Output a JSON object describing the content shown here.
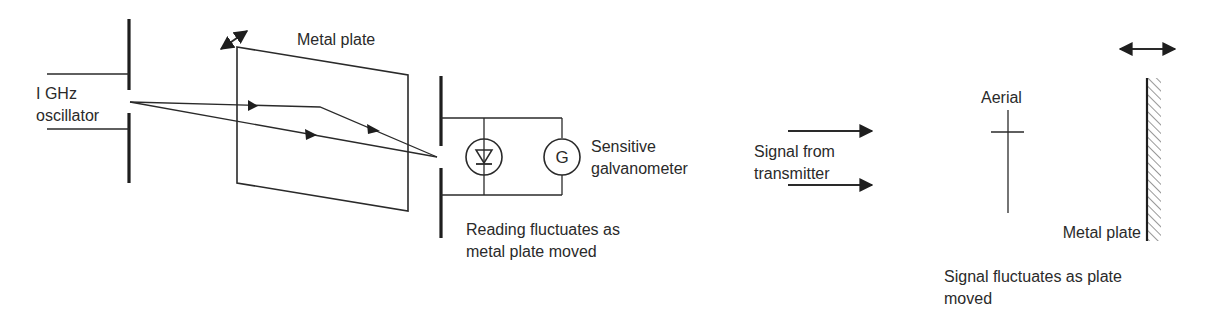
{
  "left_diagram": {
    "oscillator_label_line1": "I GHz",
    "oscillator_label_line2": "oscillator",
    "plate_label": "Metal plate",
    "galvanometer_symbol": "G",
    "galvanometer_label_line1": "Sensitive",
    "galvanometer_label_line2": "galvanometer",
    "caption_line1": "Reading fluctuates as",
    "caption_line2": "metal plate moved",
    "icons": [
      "double-arrow-icon",
      "diode-icon",
      "galvanometer-icon",
      "ray-arrow-icon"
    ]
  },
  "right_diagram": {
    "signal_label_line1": "Signal from",
    "signal_label_line2": "transmitter",
    "aerial_label": "Aerial",
    "plate_label": "Metal plate",
    "caption_line1": "Signal fluctuates as plate",
    "caption_line2": "moved",
    "icons": [
      "signal-arrow-icon",
      "aerial-icon",
      "hatched-plate-icon",
      "double-arrow-icon"
    ]
  },
  "colors": {
    "ink": "#2a2a2a",
    "background": "#ffffff"
  }
}
